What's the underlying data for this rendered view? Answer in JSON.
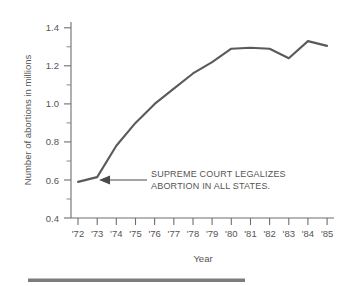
{
  "chart_data": {
    "type": "line",
    "title": "",
    "xlabel": "Year",
    "ylabel": "Number of abortions in millions",
    "x": [
      1972,
      1973,
      1974,
      1975,
      1976,
      1977,
      1978,
      1979,
      1980,
      1981,
      1982,
      1983,
      1984,
      1985
    ],
    "categories": [
      "'72",
      "'73",
      "'74",
      "'75",
      "'76",
      "'77",
      "'78",
      "'79",
      "'80",
      "'81",
      "'82",
      "'83",
      "'84",
      "'85"
    ],
    "values": [
      0.59,
      0.615,
      0.78,
      0.9,
      1.0,
      1.08,
      1.16,
      1.22,
      1.29,
      1.295,
      1.29,
      1.24,
      1.33,
      1.305
    ],
    "series": [
      {
        "name": "Number of abortions in millions",
        "values": [
          0.59,
          0.615,
          0.78,
          0.9,
          1.0,
          1.08,
          1.16,
          1.22,
          1.29,
          1.295,
          1.29,
          1.24,
          1.33,
          1.305
        ]
      }
    ],
    "ylim": [
      0.4,
      1.4
    ],
    "ytick_labels": [
      "0.4",
      "0.6",
      "0.8",
      "1.0",
      "1.2",
      "1.4"
    ],
    "ytick_values": [
      0.4,
      0.6,
      0.8,
      1.0,
      1.2,
      1.4
    ],
    "yminor_values": [
      0.5,
      0.7,
      0.9,
      1.1,
      1.3
    ],
    "grid": false,
    "legend": "none",
    "line_color": "#5a5a5a",
    "axis_color": "#6e6e6e",
    "text_color": "#555555",
    "annotations": [
      {
        "name": "supreme-court-annotation",
        "lines": [
          "SUPREME COURT LEGALIZES",
          "ABORTION IN ALL STATES."
        ],
        "points_to_x": 1973,
        "points_to_y": 0.615,
        "arrow_direction": "left"
      }
    ]
  },
  "axes": {
    "y_title": "Number of abortions in millions",
    "x_title": "Year",
    "y_labels": [
      "1.4",
      "1.2",
      "1.0",
      "0.8",
      "0.6",
      "0.4"
    ],
    "x_labels": [
      "'72",
      "'73",
      "'74",
      "'75",
      "'76",
      "'77",
      "'78",
      "'79",
      "'80",
      "'81",
      "'82",
      "'83",
      "'84",
      "'85"
    ]
  },
  "annotation": {
    "line1": "SUPREME COURT LEGALIZES",
    "line2": "ABORTION IN ALL STATES."
  },
  "footer": {
    "bar_color": "#7c7c7c"
  }
}
